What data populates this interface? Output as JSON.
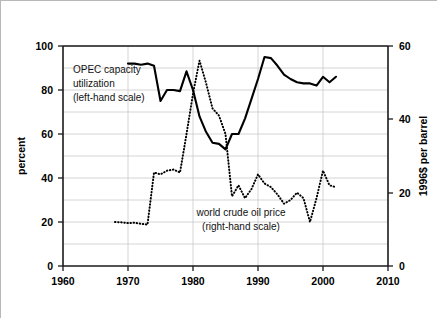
{
  "chart_data": {
    "type": "line",
    "title": "",
    "xlabel": "",
    "ylabel": "percent",
    "y2label": "1996$ per barrel",
    "xlim": [
      1960,
      2010
    ],
    "ylim": [
      0,
      100
    ],
    "y2lim": [
      0,
      60
    ],
    "grid": true,
    "legend_position": "inline-annotations",
    "x_ticks": [
      "1960",
      "1970",
      "1980",
      "1990",
      "2000",
      "2010"
    ],
    "y_ticks": [
      "0",
      "20",
      "40",
      "60",
      "80",
      "100"
    ],
    "y2_ticks": [
      "0",
      "20",
      "40",
      "60"
    ],
    "series": [
      {
        "name": "OPEC capacity utilization",
        "axis": "left",
        "style": "solid",
        "units": "percent",
        "x": [
          1970,
          1971,
          1972,
          1973,
          1974,
          1975,
          1976,
          1977,
          1978,
          1979,
          1980,
          1981,
          1982,
          1983,
          1984,
          1985,
          1986,
          1987,
          1988,
          1989,
          1990,
          1991,
          1992,
          1993,
          1994,
          1995,
          1996,
          1997,
          1998,
          1999,
          2000,
          2001,
          2002
        ],
        "values": [
          92,
          92,
          91.5,
          92,
          91,
          75,
          80,
          80,
          79.5,
          88.5,
          80,
          68,
          61,
          56,
          55.5,
          53,
          60,
          60,
          67,
          76,
          85,
          95,
          94.5,
          91,
          87,
          85,
          83.5,
          83,
          83,
          82,
          86,
          83.5,
          86
        ]
      },
      {
        "name": "world crude oil price",
        "axis": "right",
        "style": "dotted",
        "units": "1996$ per barrel",
        "x": [
          1968,
          1969,
          1970,
          1971,
          1972,
          1973,
          1974,
          1975,
          1976,
          1977,
          1978,
          1979,
          1980,
          1981,
          1982,
          1983,
          1984,
          1985,
          1986,
          1987,
          1988,
          1989,
          1990,
          1991,
          1992,
          1993,
          1994,
          1995,
          1996,
          1997,
          1998,
          1999,
          2000,
          2001,
          2002
        ],
        "values": [
          12,
          11.9,
          11.7,
          11.8,
          11.5,
          11.3,
          25.5,
          25,
          26,
          26.3,
          25.5,
          36,
          47,
          56,
          50,
          43,
          41,
          36,
          19,
          22,
          18.5,
          21,
          25,
          22.5,
          21.5,
          19.5,
          17,
          18,
          20,
          18.5,
          12,
          18.5,
          26,
          22,
          21.5
        ]
      }
    ],
    "annotations": [
      {
        "name": "opec-label",
        "lines": [
          "OPEC capacity",
          "utilization",
          "(left-hand scale)"
        ]
      },
      {
        "name": "oil-price-label",
        "lines": [
          "world crude oil price",
          "(right-hand scale)"
        ]
      }
    ]
  },
  "axes": {
    "left_title": "percent",
    "right_title": "1996$ per barrel",
    "x_tick_labels": [
      "1960",
      "1970",
      "1980",
      "1990",
      "2000",
      "2010"
    ],
    "left_tick_labels": [
      "100",
      "80",
      "60",
      "40",
      "20",
      "0"
    ],
    "right_tick_labels": [
      "60",
      "40",
      "20",
      "0"
    ]
  },
  "labels": {
    "opec_line1": "OPEC capacity",
    "opec_line2": "utilization",
    "opec_line3": "(left-hand scale)",
    "oil_line1": "world crude oil price",
    "oil_line2": "(right-hand scale)"
  },
  "colors": {
    "series_stroke": "#000000",
    "gridline": "#c9c9c9",
    "frame": "#1a1a1a",
    "background": "#ffffff",
    "border": "#b8b8b8"
  }
}
